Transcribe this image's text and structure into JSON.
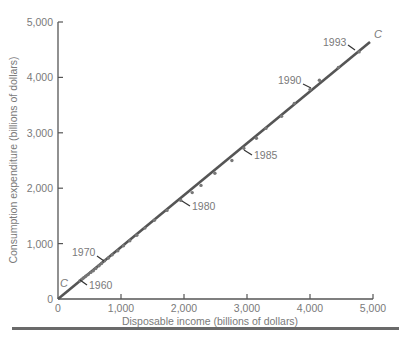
{
  "chart_data": {
    "type": "scatter",
    "title": "",
    "xlabel": "Disposable income (billions of dollars)",
    "ylabel": "Consumption expenditure (billions of dollars)",
    "xlim": [
      0,
      5000
    ],
    "ylim": [
      0,
      5000
    ],
    "x_ticks": [
      "0",
      "1,000",
      "2,000",
      "3,000",
      "4,000",
      "5,000"
    ],
    "y_ticks": [
      "0",
      "1,000",
      "2,000",
      "3,000",
      "4,000",
      "5,000"
    ],
    "grid": false,
    "legend": null,
    "line": {
      "name": "C",
      "label": "C",
      "from": [
        0,
        0
      ],
      "to": [
        4900,
        4640
      ]
    },
    "series": [
      {
        "name": "Consumption vs disposable income (annual)",
        "points": [
          {
            "x": 350,
            "y": 330,
            "label": "1960"
          },
          {
            "x": 380,
            "y": 360
          },
          {
            "x": 410,
            "y": 385
          },
          {
            "x": 440,
            "y": 410
          },
          {
            "x": 480,
            "y": 440
          },
          {
            "x": 520,
            "y": 480
          },
          {
            "x": 560,
            "y": 510
          },
          {
            "x": 600,
            "y": 550
          },
          {
            "x": 650,
            "y": 600
          },
          {
            "x": 690,
            "y": 640
          },
          {
            "x": 740,
            "y": 690,
            "label": "1970"
          },
          {
            "x": 800,
            "y": 740
          },
          {
            "x": 860,
            "y": 800
          },
          {
            "x": 950,
            "y": 870
          },
          {
            "x": 1040,
            "y": 960
          },
          {
            "x": 1140,
            "y": 1050
          },
          {
            "x": 1250,
            "y": 1150
          },
          {
            "x": 1380,
            "y": 1280
          },
          {
            "x": 1530,
            "y": 1420
          },
          {
            "x": 1730,
            "y": 1600
          },
          {
            "x": 1950,
            "y": 1780,
            "label": "1980"
          },
          {
            "x": 2130,
            "y": 1920
          },
          {
            "x": 2270,
            "y": 2050
          },
          {
            "x": 2490,
            "y": 2270
          },
          {
            "x": 2760,
            "y": 2500
          },
          {
            "x": 2950,
            "y": 2720,
            "label": "1985"
          },
          {
            "x": 3150,
            "y": 2900
          },
          {
            "x": 3300,
            "y": 3080
          },
          {
            "x": 3550,
            "y": 3300
          },
          {
            "x": 3750,
            "y": 3530
          },
          {
            "x": 4000,
            "y": 3780,
            "label": "1990"
          },
          {
            "x": 4150,
            "y": 3950
          },
          {
            "x": 4450,
            "y": 4180
          },
          {
            "x": 4780,
            "y": 4460,
            "label": "1993"
          }
        ]
      }
    ],
    "annotations": [
      "1960",
      "1970",
      "1980",
      "1985",
      "1990",
      "1993",
      "C"
    ]
  },
  "labels": {
    "x_title": "Disposable income (billions of dollars)",
    "y_title": "Consumption expenditure (billions of dollars)",
    "line_c_top": "C",
    "line_c_origin": "C",
    "x_ticks": [
      "0",
      "1,000",
      "2,000",
      "3,000",
      "4,000",
      "5,000"
    ],
    "y_ticks": [
      "0",
      "1,000",
      "2,000",
      "3,000",
      "4,000",
      "5,000"
    ],
    "year_1960": "1960",
    "year_1970": "1970",
    "year_1980": "1980",
    "year_1985": "1985",
    "year_1990": "1990",
    "year_1993": "1993"
  },
  "colors": {
    "line": "#555555",
    "points": "#777777",
    "axis": "#555555",
    "text": "#7a7a7a"
  }
}
